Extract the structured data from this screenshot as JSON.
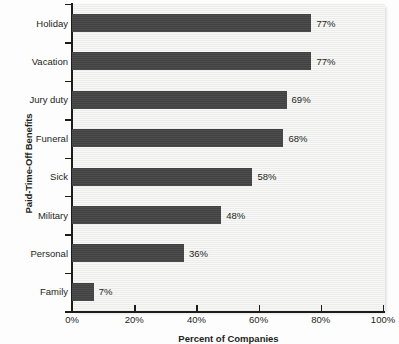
{
  "chart_data": {
    "type": "bar",
    "orientation": "horizontal",
    "title": "",
    "xlabel": "Percent of Companies",
    "ylabel": "Paid-Time-Off Benefits",
    "categories": [
      "Holiday",
      "Vacation",
      "Jury duty",
      "Funeral",
      "Sick",
      "Military",
      "Personal",
      "Family"
    ],
    "values": [
      77,
      77,
      69,
      68,
      58,
      48,
      36,
      7
    ],
    "data_labels": [
      "77%",
      "77%",
      "69%",
      "68%",
      "58%",
      "48%",
      "36%",
      "7%"
    ],
    "xlim": [
      0,
      100
    ],
    "x_tick_values": [
      0,
      20,
      40,
      60,
      80,
      100
    ],
    "x_tick_labels": [
      "0%",
      "20%",
      "40%",
      "60%",
      "80%",
      "100%"
    ],
    "grid": false,
    "legend": false,
    "bar_color": "#454545",
    "plot_background": "#f2f2f1",
    "axis_color": "#1c1c1c"
  }
}
